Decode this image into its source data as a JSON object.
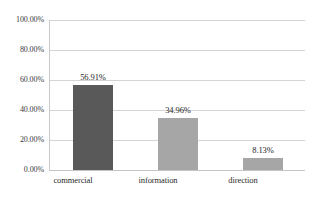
{
  "chart_data": {
    "type": "bar",
    "title": "",
    "subtitle": "",
    "xlabel": "",
    "ylabel": "",
    "categories": [
      "commercial",
      "information",
      "direction"
    ],
    "values": [
      56.91,
      34.96,
      8.13
    ],
    "value_labels": [
      "56.91%",
      "34.96%",
      "8.13%"
    ],
    "ylim": [
      0,
      100
    ],
    "ytick_values": [
      0,
      20,
      40,
      60,
      80,
      100
    ],
    "ytick_labels": [
      "0.00%",
      "20.00%",
      "40.00%",
      "60.00%",
      "80.00%",
      "100.00%"
    ],
    "grid": "horizontal",
    "legend": "none",
    "bar_colors": [
      "#595959",
      "#a6a6a6",
      "#a6a6a6"
    ],
    "gridline_color": "#d4d4d4",
    "axis_color": "#c9c9c9",
    "background_color": "#ffffff",
    "text_color": "#2b2b2b"
  }
}
